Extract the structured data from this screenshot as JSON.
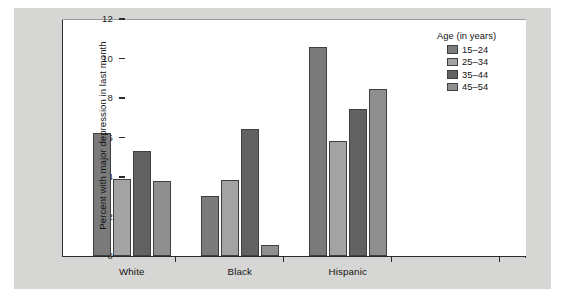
{
  "chart_data": {
    "type": "bar",
    "title": "",
    "subtitle": "",
    "xlabel": "",
    "ylabel": "Percent with major depression in last month",
    "ylim": [
      0,
      12
    ],
    "yticks": [
      0,
      2,
      4,
      6,
      8,
      10,
      12
    ],
    "ytick_labels": [
      "0",
      "2",
      "4",
      "6",
      "8",
      "10",
      "12"
    ],
    "grid": false,
    "legend_position": "top-right",
    "legend_title": "Age (in years)",
    "categories": [
      "White",
      "Black",
      "Hispanic"
    ],
    "series": [
      {
        "name": "15–24",
        "color": "#7b7b7b",
        "values": [
          6.25,
          3.05,
          10.6
        ]
      },
      {
        "name": "25–34",
        "color": "#a3a3a3",
        "values": [
          3.9,
          3.85,
          5.8
        ]
      },
      {
        "name": "35–44",
        "color": "#626262",
        "values": [
          5.3,
          6.45,
          7.45
        ]
      },
      {
        "name": "45–54",
        "color": "#8f8f8f",
        "values": [
          3.8,
          0.55,
          8.45
        ]
      }
    ],
    "colors": {
      "panel": "#d6d6d4",
      "plot_background": "#ffffff",
      "axis": "#2b2b2b",
      "bar_outline": "#3f3f3f"
    }
  }
}
